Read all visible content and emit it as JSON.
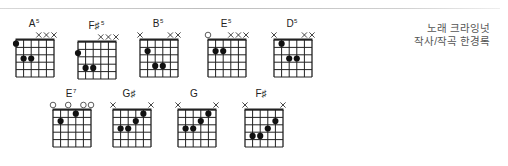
{
  "credits": {
    "line1": "노래 크라잉넛",
    "line2": "작사/작곡 한경록"
  },
  "chords": [
    {
      "name": "A",
      "sup": "5",
      "x": 16,
      "y": 40,
      "markers": [
        "",
        "",
        "",
        "X",
        "X",
        "X"
      ],
      "fretLabel": "tiny",
      "dots": [
        [
          0,
          1
        ],
        [
          1,
          3
        ],
        [
          2,
          3
        ]
      ]
    },
    {
      "name": "F♯",
      "sup": "5",
      "x": 78,
      "y": 42,
      "markers": [
        "",
        "",
        "",
        "X",
        "X",
        "X"
      ],
      "fretLabel": "",
      "dots": [
        [
          0,
          2
        ],
        [
          1,
          4
        ],
        [
          2,
          4
        ]
      ]
    },
    {
      "name": "B",
      "sup": "5",
      "x": 140,
      "y": 40,
      "markers": [
        "X",
        "",
        "",
        "",
        "X",
        "X"
      ],
      "fretLabel": "",
      "dots": [
        [
          1,
          2
        ],
        [
          2,
          4
        ],
        [
          3,
          4
        ]
      ]
    },
    {
      "name": "E",
      "sup": "5",
      "x": 208,
      "y": 40,
      "markers": [
        "O",
        "",
        "",
        "X",
        "X",
        "X"
      ],
      "fretLabel": "",
      "dots": [
        [
          1,
          2
        ],
        [
          2,
          2
        ]
      ]
    },
    {
      "name": "D",
      "sup": "5",
      "x": 274,
      "y": 40,
      "markers": [
        "X",
        "",
        "",
        "",
        "X",
        "X"
      ],
      "fretLabel": "tiny",
      "dots": [
        [
          1,
          1
        ],
        [
          2,
          3
        ],
        [
          3,
          3
        ]
      ]
    },
    {
      "name": "E",
      "sup": "7",
      "x": 53,
      "y": 110,
      "markers": [
        "O",
        "",
        "O",
        "",
        "O",
        "O"
      ],
      "fretLabel": "",
      "dots": [
        [
          1,
          2
        ],
        [
          3,
          1
        ]
      ]
    },
    {
      "name": "G♯",
      "sup": "",
      "x": 113,
      "y": 110,
      "markers": [
        "X",
        "",
        "",
        "",
        "",
        "X"
      ],
      "fretLabel": "tiny",
      "dots": [
        [
          1,
          3
        ],
        [
          2,
          3
        ],
        [
          3,
          2
        ],
        [
          4,
          1
        ]
      ]
    },
    {
      "name": "G",
      "sup": "",
      "x": 178,
      "y": 110,
      "markers": [
        "X",
        "",
        "",
        "",
        "",
        "X"
      ],
      "fretLabel": "tiny",
      "dots": [
        [
          1,
          3
        ],
        [
          2,
          3
        ],
        [
          3,
          2
        ],
        [
          4,
          1
        ]
      ]
    },
    {
      "name": "F♯",
      "sup": "",
      "x": 245,
      "y": 110,
      "markers": [
        "X",
        "",
        "",
        "",
        "",
        "X"
      ],
      "fretLabel": "",
      "dots": [
        [
          1,
          4
        ],
        [
          2,
          4
        ],
        [
          3,
          3
        ],
        [
          4,
          2
        ]
      ]
    }
  ]
}
